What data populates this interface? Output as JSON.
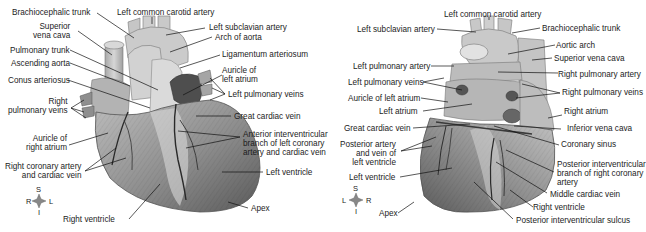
{
  "figure": {
    "type": "anatomical-illustration",
    "panels": [
      {
        "id": "anterior",
        "view": "anterior",
        "labels": [
          {
            "text": "Brachiocephalic trunk"
          },
          {
            "text": "Superior\nvena cava"
          },
          {
            "text": "Pulmonary trunk"
          },
          {
            "text": "Ascending aorta"
          },
          {
            "text": "Conus arteriosus"
          },
          {
            "text": "Right\npulmonary veins"
          },
          {
            "text": "Auricle of\nright atrium"
          },
          {
            "text": "Right coronary artery\nand cardiac vein"
          },
          {
            "text": "Right ventricle"
          },
          {
            "text": "Left common carotid artery"
          },
          {
            "text": "Left subclavian artery"
          },
          {
            "text": "Arch of aorta"
          },
          {
            "text": "Ligamentum arteriosum"
          },
          {
            "text": "Auricle of\nleft atrium"
          },
          {
            "text": "Left pulmonary veins"
          },
          {
            "text": "Great cardiac vein"
          },
          {
            "text": "Anterior interventricular\nbranch of left coronary\nartery and cardiac vein"
          },
          {
            "text": "Left ventricle"
          },
          {
            "text": "Apex"
          }
        ],
        "orientation": {
          "top": "S",
          "bottom": "I",
          "left": "R",
          "right": "L"
        }
      },
      {
        "id": "posterior",
        "view": "posterior",
        "labels": [
          {
            "text": "Left common carotid artery"
          },
          {
            "text": "Left subclavian artery"
          },
          {
            "text": "Left pulmonary artery"
          },
          {
            "text": "Left pulmonary veins"
          },
          {
            "text": "Auricle of left atrium"
          },
          {
            "text": "Left atrium"
          },
          {
            "text": "Great cardiac vein"
          },
          {
            "text": "Posterior artery\nand vein of\nleft ventricle"
          },
          {
            "text": "Left ventricle"
          },
          {
            "text": "Apex"
          },
          {
            "text": "Brachiocephalic trunk"
          },
          {
            "text": "Aortic arch"
          },
          {
            "text": "Superior vena cava"
          },
          {
            "text": "Right pulmonary artery"
          },
          {
            "text": "Right pulmonary veins"
          },
          {
            "text": "Right atrium"
          },
          {
            "text": "Inferior vena cava"
          },
          {
            "text": "Coronary sinus"
          },
          {
            "text": "Posterior interventricular\nbranch of right coronary\nartery"
          },
          {
            "text": "Middle cardiac vein"
          },
          {
            "text": "Right ventricle"
          },
          {
            "text": "Posterior interventricular sulcus"
          }
        ],
        "orientation": {
          "top": "S",
          "bottom": "I",
          "left": "L",
          "right": "R"
        }
      }
    ],
    "colors": {
      "background": "#ffffff",
      "text": "#1c1c1c",
      "line": "#111111",
      "tissue_light": "#c9c9c9",
      "tissue_mid": "#9a9a9a",
      "tissue_dark": "#5e5e5e"
    }
  }
}
